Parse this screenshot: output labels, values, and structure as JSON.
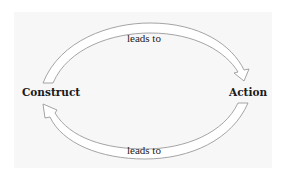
{
  "diagram": {
    "type": "cycle",
    "nodes": [
      {
        "id": "construct",
        "label": "Construct"
      },
      {
        "id": "action",
        "label": "Action"
      }
    ],
    "edges": [
      {
        "from": "construct",
        "to": "action",
        "label": "leads to",
        "position": "top"
      },
      {
        "from": "action",
        "to": "construct",
        "label": "leads to",
        "position": "bottom"
      }
    ],
    "colors": {
      "arrow_stroke": "#9a9a9a",
      "arrow_fill": "#ffffff",
      "background": "#f7f7f7",
      "text": "#1a1a1a"
    }
  }
}
